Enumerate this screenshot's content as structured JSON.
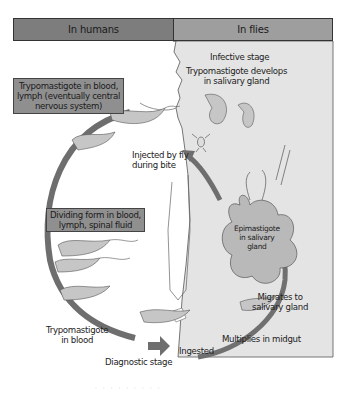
{
  "header": {
    "left_panel": "In humans",
    "right_panel": "In flies"
  },
  "colors": {
    "humans_header": "#7d7d7d",
    "flies_header": "#9e9e9e",
    "flies_panel": "#e4e4e4",
    "arrow": "#6e6e6e",
    "label_box": "#8f8f8f"
  },
  "human_stages": {
    "box_top": "Trypomastigote in blood,\nlymph (eventually central\nnervous system)",
    "box_middle": "Dividing form in blood,\nlymph, spinal fluid",
    "trypo_blood": "Trypomastigote\nin blood",
    "diagnostic": "Diagnostic stage",
    "injected": "Injected by fly\nduring bite"
  },
  "fly_stages": {
    "infective": "Infective stage",
    "develops": "Trypomastigote develops\nin salivary gland",
    "epimastigote": "Epimastigote\nin salivary\ngland",
    "migrates": "Migrates to\nsalivary gland",
    "multiplies": "Multiplies in midgut",
    "ingested": "Ingested"
  },
  "caption": "· · · · · · · · ·"
}
